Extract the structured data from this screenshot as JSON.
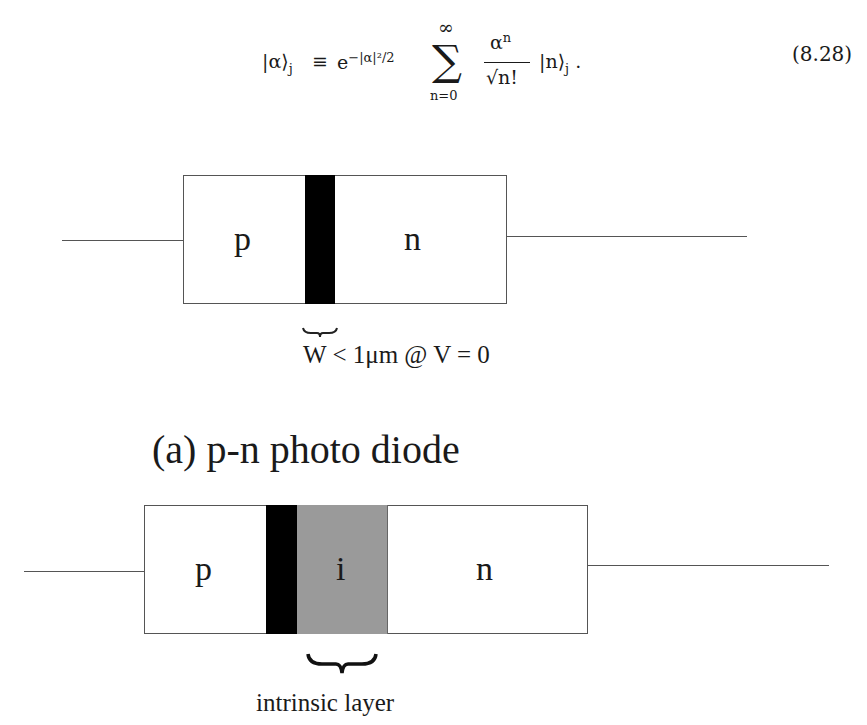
{
  "equation": {
    "lhs_ket": "|α⟩",
    "lhs_sub": "j",
    "equiv": "≡",
    "exp_base": "e",
    "exp_power": "−|α|²/2",
    "sum_symbol": "∑",
    "sum_upper": "∞",
    "sum_lower": "n=0",
    "frac_numerator_base": "α",
    "frac_numerator_power": "n",
    "frac_denominator": "√n!",
    "rhs_ket": "|n⟩",
    "rhs_sub": "j",
    "trailing_punct": ".",
    "number": "(8.28)"
  },
  "diagram_a": {
    "regions": [
      {
        "label": "p",
        "type": "p-doped"
      },
      {
        "label": "",
        "type": "depletion"
      },
      {
        "label": "n",
        "type": "n-doped"
      }
    ],
    "brace_label": "W < 1μm @ V = 0",
    "caption": "(a)  p-n photo diode"
  },
  "diagram_b": {
    "regions": [
      {
        "label": "p",
        "type": "p-doped"
      },
      {
        "label": "",
        "type": "depletion"
      },
      {
        "label": "i",
        "type": "intrinsic"
      },
      {
        "label": "n",
        "type": "n-doped"
      }
    ],
    "brace_label": "intrinsic layer"
  },
  "colors": {
    "depletion": "#000000",
    "intrinsic": "#9a9a9a",
    "outline": "#555555"
  }
}
